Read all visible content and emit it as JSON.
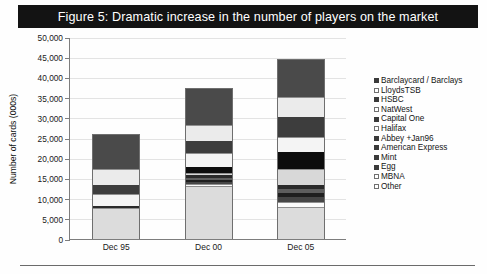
{
  "figure": {
    "title": "Figure 5: Dramatic increase in the number of players on the market",
    "title_bg": "#131313",
    "title_color": "#ffffff"
  },
  "chart_data": {
    "type": "bar",
    "stacked": true,
    "title": "Figure 5: Dramatic increase in the number of players on the market",
    "xlabel": "",
    "ylabel": "Number of cards (000s)",
    "categories": [
      "Dec 95",
      "Dec 00",
      "Dec 05"
    ],
    "ylim": [
      0,
      50000
    ],
    "yticks": [
      0,
      5000,
      10000,
      15000,
      20000,
      25000,
      30000,
      35000,
      40000,
      45000,
      50000
    ],
    "ytick_labels": [
      "0",
      "5,000",
      "10,000",
      "15,000",
      "20,000",
      "25,000",
      "30,000",
      "35,000",
      "40,000",
      "45,000",
      "50,000"
    ],
    "grid": true,
    "legend_position": "right",
    "totals": [
      26000,
      37500,
      44500
    ],
    "series": [
      {
        "name": "Barclaycard / Barclays",
        "color": "#4a4a4a",
        "marker": "filled",
        "values": [
          8500,
          9000,
          9200
        ]
      },
      {
        "name": "LloydsTSB",
        "color": "#ebebeb",
        "marker": "outline",
        "values": [
          4000,
          4000,
          5000
        ]
      },
      {
        "name": "HSBC",
        "color": "#3d3d3d",
        "marker": "filled",
        "values": [
          2300,
          3000,
          5000
        ]
      },
      {
        "name": "NatWest",
        "color": "#f4f4f4",
        "marker": "outline",
        "values": [
          3000,
          3600,
          3700
        ]
      },
      {
        "name": "Capital One",
        "color": "#0d0d0d",
        "marker": "filled",
        "values": [
          0,
          1400,
          4200
        ]
      },
      {
        "name": "Halifax",
        "color": "#d8d8d8",
        "marker": "outline",
        "values": [
          0,
          600,
          4000
        ]
      },
      {
        "name": "Abbey +Jan96",
        "color": "#2a2a2a",
        "marker": "filled",
        "values": [
          500,
          700,
          1000
        ]
      },
      {
        "name": "American Express",
        "color": "#5e5e5e",
        "marker": "filled",
        "values": [
          0,
          500,
          900
        ]
      },
      {
        "name": "Mint",
        "color": "#1f1f1f",
        "marker": "filled",
        "values": [
          0,
          400,
          1100
        ]
      },
      {
        "name": "Egg",
        "color": "#464646",
        "marker": "filled",
        "values": [
          0,
          500,
          1300
        ]
      },
      {
        "name": "MBNA",
        "color": "#fbfbfb",
        "marker": "outline",
        "values": [
          0,
          500,
          1100
        ]
      },
      {
        "name": "Other",
        "color": "#dcdcdc",
        "marker": "outline",
        "values": [
          7700,
          13300,
          8000
        ]
      }
    ]
  }
}
